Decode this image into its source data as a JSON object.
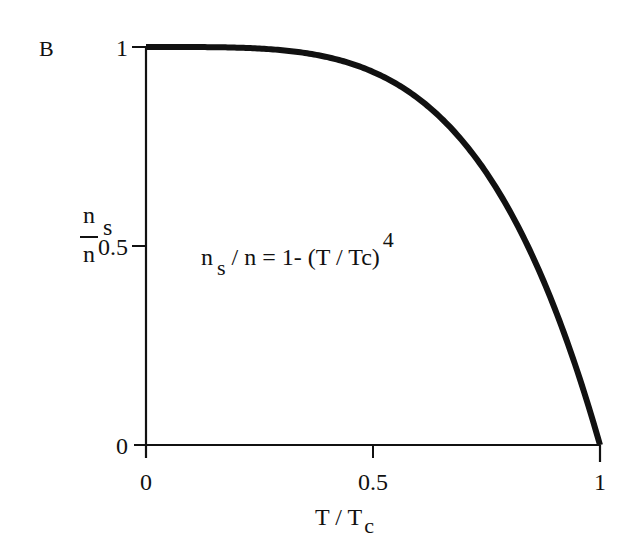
{
  "panel_label": "B",
  "y_axis": {
    "label_num": "n",
    "label_den": "n",
    "label_sub": "s",
    "ticks": [
      "1",
      "0.5",
      "0"
    ]
  },
  "x_axis": {
    "label_main": "T / T",
    "label_sub": "c",
    "ticks": [
      "0",
      "0.5",
      "1"
    ]
  },
  "annotation": {
    "pre": "n",
    "sub": "s",
    "post": "/ n = 1- (T / Tc)",
    "sup": "4"
  },
  "colors": {
    "line": "#111111",
    "axes": "#111111",
    "background": "#ffffff"
  },
  "chart_data": {
    "type": "line",
    "title": "",
    "panel": "B",
    "xlabel": "T / Tc",
    "ylabel": "ns / n",
    "xlim": [
      0,
      1
    ],
    "ylim": [
      0,
      1
    ],
    "x_ticks": [
      0,
      0.5,
      1
    ],
    "y_ticks": [
      0,
      0.5,
      1
    ],
    "grid": false,
    "legend": null,
    "annotations": [
      "ns / n = 1- (T / Tc)^4"
    ],
    "series": [
      {
        "name": "ns/n = 1 - (T/Tc)^4",
        "x": [
          0,
          0.1,
          0.2,
          0.3,
          0.4,
          0.5,
          0.6,
          0.7,
          0.8,
          0.9,
          1.0
        ],
        "values": [
          1.0,
          0.9999,
          0.9984,
          0.9919,
          0.9744,
          0.9375,
          0.8704,
          0.7599,
          0.5904,
          0.3439,
          0.0
        ]
      }
    ]
  }
}
